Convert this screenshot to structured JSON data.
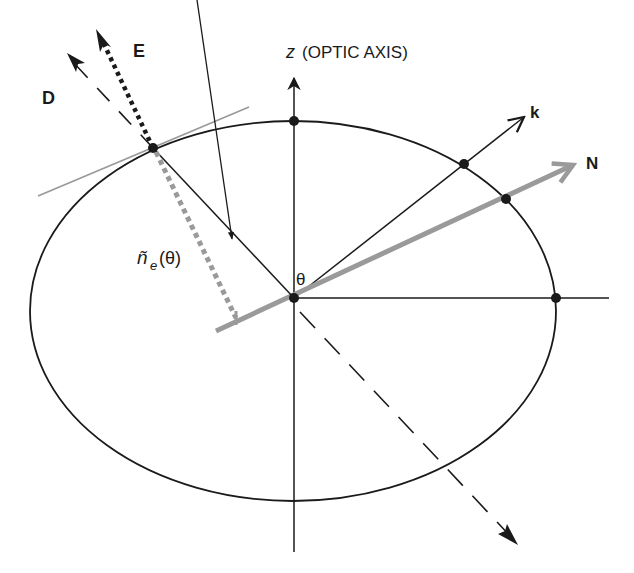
{
  "diagram": {
    "labels": {
      "z_axis": "z",
      "z_axis_note": "(OPTIC AXIS)",
      "E": "E",
      "D": "D",
      "k": "k",
      "N": "N",
      "theta": "θ",
      "n_tilde": "ñ",
      "n_sub": "e",
      "n_arg": "(θ)"
    },
    "colors": {
      "line": "#1a1a1a",
      "gray": "#9a9a9a",
      "background": "#ffffff"
    },
    "elements": [
      "index-ellipse",
      "z-optic-axis",
      "horizontal-axis",
      "k-vector",
      "N-vector (gray)",
      "D-vector (dashed)",
      "E-vector (dotted)",
      "tangent-line (gray)",
      "n_e(theta) dimension marker",
      "dashed direction arrow (lower right)"
    ]
  }
}
